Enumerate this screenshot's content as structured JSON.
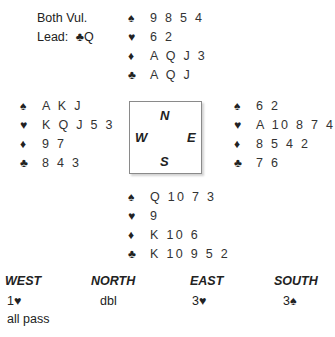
{
  "deal_info": {
    "vulnerability": "Both Vul.",
    "lead_label": "Lead:",
    "lead_suit": "♣",
    "lead_card": "Q"
  },
  "suit_symbols": {
    "spades": "♠",
    "hearts": "♥",
    "diamonds": "♦",
    "clubs": "♣"
  },
  "hands": {
    "north": {
      "spades": "9 8 5 4",
      "hearts": "6 2",
      "diamonds": "A Q J 3",
      "clubs": "A Q J"
    },
    "west": {
      "spades": "A K J",
      "hearts": "K Q J 5 3",
      "diamonds": "9 7",
      "clubs": "8 4 3"
    },
    "east": {
      "spades": "6 2",
      "hearts": "A 10 8 7 4",
      "diamonds": "8 5 4 2",
      "clubs": "7 6"
    },
    "south": {
      "spades": "Q 10 7 3",
      "hearts": "9",
      "diamonds": "K 10 6",
      "clubs": "K 10 9 5 2"
    }
  },
  "compass": {
    "north": "N",
    "west": "W",
    "east": "E",
    "south": "S"
  },
  "auction": {
    "headers": [
      "WEST",
      "NORTH",
      "EAST",
      "SOUTH"
    ],
    "rounds": [
      [
        "1♥",
        "dbl",
        "3♥",
        "3♠"
      ],
      [
        "all pass",
        "",
        "",
        ""
      ]
    ]
  }
}
